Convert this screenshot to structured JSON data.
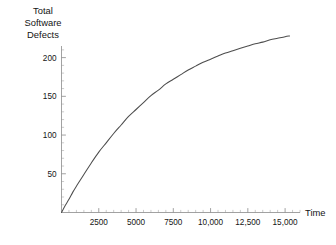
{
  "chart_data": {
    "type": "line",
    "title": "",
    "subtitle": "",
    "ylabel": "Total Software Defects",
    "ylabel_lines": [
      "Total",
      "Software",
      "Defects"
    ],
    "xlabel": "Time",
    "xlim": [
      0,
      16000
    ],
    "ylim": [
      0,
      215
    ],
    "grid": false,
    "legend": null,
    "x_ticks": [
      2500,
      5000,
      7500,
      10000,
      12500,
      15000
    ],
    "x_tick_labels": [
      "2500",
      "5000",
      "7500",
      "10,000",
      "12,500",
      "15,000"
    ],
    "x_minor_step": 500,
    "y_ticks": [
      50,
      100,
      150,
      200
    ],
    "y_tick_labels": [
      "50",
      "100",
      "150",
      "200"
    ],
    "y_minor_step": 10,
    "series": [
      {
        "name": "Cumulative defects",
        "color": "#4d4d4d",
        "x": [
          0,
          250,
          500,
          750,
          1000,
          1500,
          2000,
          2500,
          3000,
          3500,
          4000,
          4500,
          5000,
          5500,
          6000,
          6500,
          7000,
          7500,
          8000,
          8500,
          9000,
          9500,
          10000,
          10500,
          11000,
          11500,
          12000,
          12500,
          13000,
          13500,
          14000,
          14500,
          15000,
          15300
        ],
        "y": [
          0,
          9,
          17,
          26,
          34,
          49,
          64,
          78,
          90,
          102,
          113,
          124,
          133,
          142,
          151,
          158,
          166,
          172,
          178,
          184,
          189,
          194,
          198,
          202,
          206,
          209,
          212,
          215,
          218,
          220,
          223,
          225,
          227,
          228
        ]
      }
    ]
  },
  "axis_colors": {
    "axis": "#8a8a8a",
    "minor_tick": "#a8a8a8",
    "curve": "#4d4d4d",
    "text": "#141414",
    "background": "#ffffff"
  }
}
